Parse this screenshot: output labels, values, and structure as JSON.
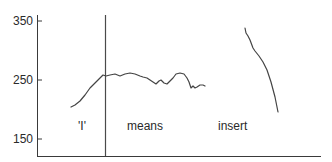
{
  "chart_data": {
    "type": "line",
    "title": "",
    "xlabel": "",
    "ylabel": "",
    "ylim": [
      140,
      360
    ],
    "yticks": [
      350,
      250,
      150
    ],
    "grid": false,
    "legend": null,
    "annotations": [
      {
        "text": "'I'",
        "x": 78,
        "y": 126
      },
      {
        "text": "means",
        "x": 127,
        "y": 126
      },
      {
        "text": "insert",
        "x": 218,
        "y": 126
      }
    ],
    "vertical_marker": {
      "x_px": 105
    },
    "series": [
      {
        "name": "contour-1",
        "points_px": [
          [
            71,
            107
          ],
          [
            75,
            105
          ],
          [
            80,
            101
          ],
          [
            85,
            95
          ],
          [
            90,
            88
          ],
          [
            95,
            83
          ],
          [
            100,
            78
          ],
          [
            103,
            75
          ],
          [
            106,
            76
          ],
          [
            110,
            75
          ],
          [
            115,
            74
          ],
          [
            120,
            76
          ],
          [
            125,
            74
          ],
          [
            130,
            73
          ],
          [
            135,
            74
          ],
          [
            140,
            76
          ],
          [
            143,
            77
          ],
          [
            147,
            78
          ],
          [
            150,
            80
          ],
          [
            153,
            82
          ],
          [
            156,
            84
          ],
          [
            159,
            81
          ],
          [
            161,
            80
          ],
          [
            164,
            83
          ],
          [
            167,
            84
          ],
          [
            170,
            81
          ],
          [
            173,
            78
          ],
          [
            176,
            74
          ],
          [
            180,
            73
          ],
          [
            184,
            74
          ],
          [
            187,
            78
          ],
          [
            189,
            82
          ],
          [
            191,
            88
          ],
          [
            193,
            86
          ],
          [
            195,
            88
          ],
          [
            197,
            87
          ],
          [
            200,
            85
          ],
          [
            203,
            85
          ],
          [
            205,
            86
          ]
        ],
        "approx_values": [
          {
            "x": "start",
            "y": 195
          },
          {
            "x": "marker",
            "y": 258
          },
          {
            "x": "mid",
            "y": 255
          },
          {
            "x": "end",
            "y": 240
          }
        ]
      },
      {
        "name": "contour-2",
        "points_px": [
          [
            245,
            28
          ],
          [
            246,
            33
          ],
          [
            248,
            36
          ],
          [
            250,
            40
          ],
          [
            253,
            48
          ],
          [
            255,
            51
          ],
          [
            259,
            56
          ],
          [
            263,
            62
          ],
          [
            267,
            70
          ],
          [
            271,
            82
          ],
          [
            275,
            97
          ],
          [
            278,
            112
          ]
        ],
        "approx_values": [
          {
            "x": "start",
            "y": 340
          },
          {
            "x": "end",
            "y": 198
          }
        ]
      }
    ]
  },
  "axis": {
    "y_tick_labels": [
      "350",
      "250",
      "150"
    ]
  },
  "labels": {
    "label_1": "'I'",
    "label_2": "means",
    "label_3": "insert"
  }
}
